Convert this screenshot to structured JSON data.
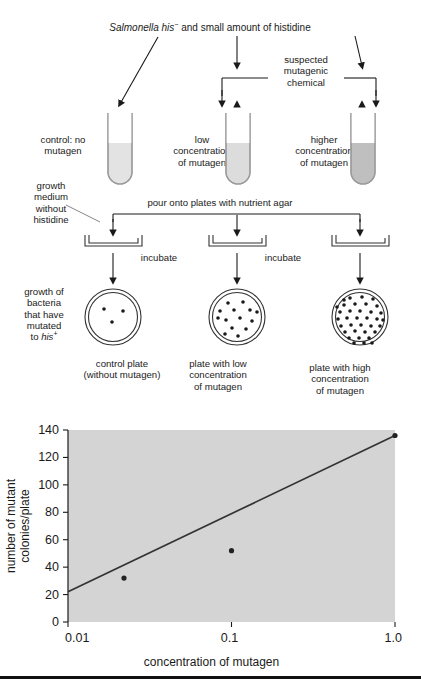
{
  "figure": {
    "title_text": "Salmonella his⁻ and small amount of histidine",
    "title_italic": "Salmonella his",
    "title_sup": "−",
    "title_rest": " and small amount of histidine",
    "chemical_label": "suspected\nmutagenic\nchemical",
    "chemical_label_lines": [
      "suspected",
      "mutagenic",
      "chemical"
    ],
    "pour_label": "pour onto plates with nutrient agar"
  },
  "tubes": [
    {
      "id": "control",
      "label_lines": [
        "control: no",
        "mutagen"
      ],
      "fill": "#e3e3e3"
    },
    {
      "id": "low",
      "label_lines": [
        "low",
        "concentration",
        "of mutagen"
      ],
      "fill": "#d9d9d9"
    },
    {
      "id": "high",
      "label_lines": [
        "higher",
        "concentration",
        "of mutagen"
      ],
      "fill": "#bfbfbf"
    }
  ],
  "side_labels": {
    "growth_medium_lines": [
      "growth",
      "medium",
      "without",
      "histidine"
    ],
    "growth_bacteria_lines": [
      "growth of",
      "bacteria",
      "that have",
      "mutated",
      "to his⁺"
    ],
    "growth_bacteria_last_plain": "to ",
    "growth_bacteria_last_italic": "his",
    "growth_bacteria_last_sup": "+"
  },
  "incubate_labels": [
    "incubate",
    "incubate"
  ],
  "plates": [
    {
      "id": "control-plate",
      "caption_lines": [
        "control plate",
        "(without mutagen)"
      ],
      "colonies": 3
    },
    {
      "id": "low-plate",
      "caption_lines": [
        "plate with low",
        "concentration",
        "of mutagen"
      ],
      "colonies": 14
    },
    {
      "id": "high-plate",
      "caption_lines": [
        "plate with high",
        "concentration",
        "of mutagen"
      ],
      "colonies": 35
    }
  ],
  "chart_data": {
    "type": "line",
    "title": "",
    "xlabel": "concentration of mutagen",
    "ylabel": "number of mutant colonies/plate",
    "xscale": "log",
    "xlim": [
      0.01,
      1.0
    ],
    "ylim": [
      0,
      140
    ],
    "xticks": [
      0.01,
      0.1,
      1.0
    ],
    "xticklabels": [
      "0.01",
      "0.1",
      "1.0"
    ],
    "yticks": [
      0,
      20,
      40,
      60,
      80,
      100,
      120,
      140
    ],
    "yticklabels": [
      "0",
      "20",
      "40",
      "60",
      "80",
      "100",
      "120",
      "140"
    ],
    "grid": false,
    "legend": "none",
    "plot_background": "#d4d4d4",
    "line_color": "#333333",
    "marker_color": "#222222",
    "series": [
      {
        "name": "mutant colonies",
        "x": [
          0.022,
          0.1,
          1.0
        ],
        "y": [
          32,
          52,
          136
        ]
      }
    ],
    "fit_line": {
      "x": [
        0.01,
        1.0
      ],
      "y": [
        22,
        136
      ]
    }
  },
  "colors": {
    "ink": "#1a1a1a",
    "stroke": "#555555",
    "plot_bg": "#d4d4d4",
    "page_bg": "#ffffff"
  }
}
